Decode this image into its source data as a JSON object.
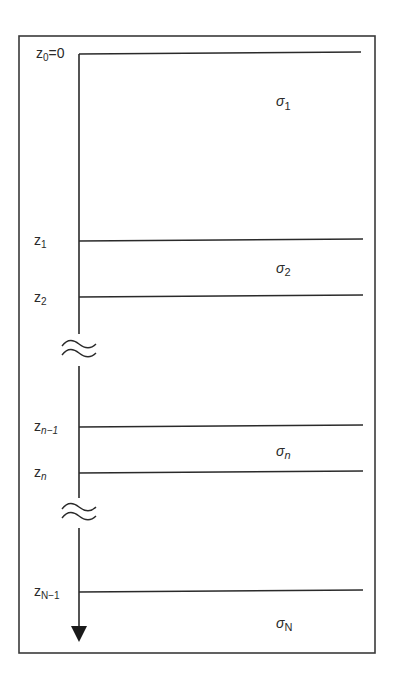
{
  "diagram": {
    "type": "layered-half-space",
    "axis": {
      "label": "z",
      "direction": "down"
    },
    "interfaces": [
      {
        "id": "z0",
        "base": "z",
        "sub": "0",
        "suffix": "=0",
        "y": 53
      },
      {
        "id": "z1",
        "base": "z",
        "sub": "1",
        "suffix": "",
        "y": 240
      },
      {
        "id": "z2",
        "base": "z",
        "sub": "2",
        "suffix": "",
        "y": 296
      },
      {
        "id": "zn-1",
        "base": "z",
        "sub": "n−1",
        "suffix": "",
        "y": 426
      },
      {
        "id": "zn",
        "base": "z",
        "sub": "n",
        "suffix": "",
        "y": 472
      },
      {
        "id": "zN-1",
        "base": "z",
        "sub": "N−1",
        "suffix": "",
        "y": 591
      }
    ],
    "layers": [
      {
        "id": "sigma1",
        "base": "σ",
        "sub": "1",
        "y": 106
      },
      {
        "id": "sigma2",
        "base": "σ",
        "sub": "2",
        "y": 271
      },
      {
        "id": "sigman",
        "base": "σ",
        "sub": "n",
        "y": 454
      },
      {
        "id": "sigmaN",
        "base": "σ",
        "sub": "N",
        "y": 626
      }
    ],
    "breaks": [
      {
        "id": "break-1",
        "symbol": "≈",
        "y": 350
      },
      {
        "id": "break-2",
        "symbol": "≈",
        "y": 513
      }
    ]
  }
}
